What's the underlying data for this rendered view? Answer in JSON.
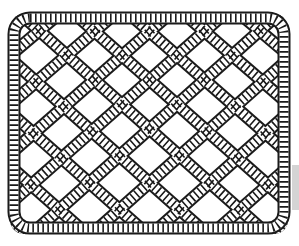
{
  "image": {
    "subject": "Celtic knot rope interlace pattern",
    "description": "Black-and-white line art of an interwoven rope knot lattice with looped borders"
  },
  "colors": {
    "background": "#ffffff",
    "rope_outline": "#1a1a1a",
    "rope_fill": "#ffffff",
    "edge_bar": "#d4d4d4"
  },
  "pattern": {
    "bounds": {
      "x": 13,
      "y": 17,
      "width": 272,
      "height": 213
    },
    "columns": 5,
    "rows": 4
  }
}
